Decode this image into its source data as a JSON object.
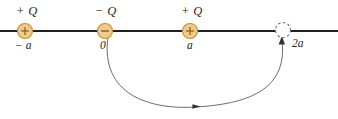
{
  "figure": {
    "type": "physics-diagram",
    "background_color": "#ffffff",
    "axis": {
      "color": "#231f20",
      "y": 31,
      "x_start": 0,
      "x_end": 338,
      "thickness": 1.8
    },
    "charges": [
      {
        "id": "charge-left",
        "label": "+ Q",
        "sign": "+",
        "position_label": "− a",
        "cx": 25,
        "cy": 31,
        "r": 7.5,
        "fill": "#edca8e",
        "stroke": "#c98a2e",
        "filled": true
      },
      {
        "id": "charge-center",
        "label": "− Q",
        "sign": "−",
        "position_label": "0",
        "cx": 105,
        "cy": 31,
        "r": 7.5,
        "fill": "#edca8e",
        "stroke": "#c98a2e",
        "filled": true
      },
      {
        "id": "charge-right",
        "label": "+ Q",
        "sign": "+",
        "position_label": "a",
        "cx": 190,
        "cy": 31,
        "r": 7.5,
        "fill": "#edca8e",
        "stroke": "#c98a2e",
        "filled": true
      },
      {
        "id": "charge-target",
        "label": "",
        "sign": "",
        "position_label": "2a",
        "cx": 283,
        "cy": 30,
        "r": 7.5,
        "fill": "none",
        "stroke": "#6e6e6e",
        "filled": false
      }
    ],
    "trajectory": {
      "color": "#5a5a5a",
      "thickness": 0.9,
      "start_x": 108,
      "start_y": 37,
      "end_x": 282,
      "end_y": 39,
      "bottom_y": 108,
      "direction_arrow_x": 196,
      "direction_arrow_y": 106,
      "end_arrow_label": "upward arrowhead into dashed circle"
    }
  }
}
